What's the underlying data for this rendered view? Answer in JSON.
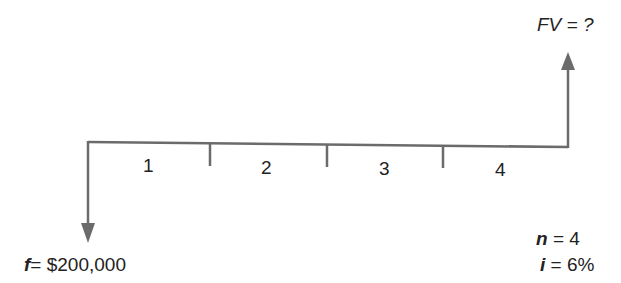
{
  "diagram": {
    "type": "cash-flow-timeline",
    "periods": [
      "1",
      "2",
      "3",
      "4"
    ],
    "present_value": {
      "var": "f",
      "eq": "= $200,000"
    },
    "future_value": {
      "var": "FV",
      "eq": "= ?"
    },
    "params": {
      "n": {
        "var": "n",
        "eq": "= 4"
      },
      "i": {
        "var": "i",
        "eq": "= 6%"
      }
    },
    "colors": {
      "line": "#6b6b6b",
      "text": "#222222"
    }
  }
}
